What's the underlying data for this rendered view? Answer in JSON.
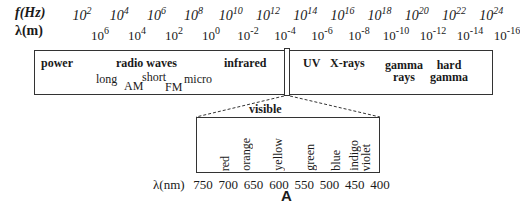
{
  "axes": {
    "frequency_label": "f(Hz)",
    "wavelength_label": "λ(m)",
    "frequency_ticks": [
      {
        "base": "10",
        "exp": "2"
      },
      {
        "base": "10",
        "exp": "4"
      },
      {
        "base": "10",
        "exp": "6"
      },
      {
        "base": "10",
        "exp": "8"
      },
      {
        "base": "10",
        "exp": "10"
      },
      {
        "base": "10",
        "exp": "12"
      },
      {
        "base": "10",
        "exp": "14"
      },
      {
        "base": "10",
        "exp": "16"
      },
      {
        "base": "10",
        "exp": "18"
      },
      {
        "base": "10",
        "exp": "20"
      },
      {
        "base": "10",
        "exp": "22"
      },
      {
        "base": "10",
        "exp": "24"
      }
    ],
    "wavelength_ticks": [
      {
        "base": "10",
        "exp": "6"
      },
      {
        "base": "10",
        "exp": "4"
      },
      {
        "base": "10",
        "exp": "2"
      },
      {
        "base": "10",
        "exp": "0"
      },
      {
        "base": "10",
        "exp": "-2"
      },
      {
        "base": "10",
        "exp": "-4"
      },
      {
        "base": "10",
        "exp": "-6"
      },
      {
        "base": "10",
        "exp": "-8"
      },
      {
        "base": "10",
        "exp": "-10"
      },
      {
        "base": "10",
        "exp": "-12"
      },
      {
        "base": "10",
        "exp": "-14"
      },
      {
        "base": "10",
        "exp": "-16"
      }
    ]
  },
  "bands": {
    "power": "power",
    "radio_waves": "radio waves",
    "long": "long",
    "am": "AM",
    "short": "short",
    "fm": "FM",
    "micro": "micro",
    "infrared": "infrared",
    "uv": "UV",
    "xrays": "X-rays",
    "gamma_line1": "gamma",
    "gamma_line2": "rays",
    "hard_line1": "hard",
    "hard_line2": "gamma"
  },
  "visible": {
    "title": "visible",
    "colors": [
      "red",
      "orange",
      "yellow",
      "green",
      "blue",
      "indigo",
      "violet"
    ],
    "nm_label": "λ(nm)",
    "nm_ticks": [
      "750",
      "700",
      "650",
      "600",
      "550",
      "500",
      "450",
      "400"
    ]
  },
  "panel_label": "A"
}
